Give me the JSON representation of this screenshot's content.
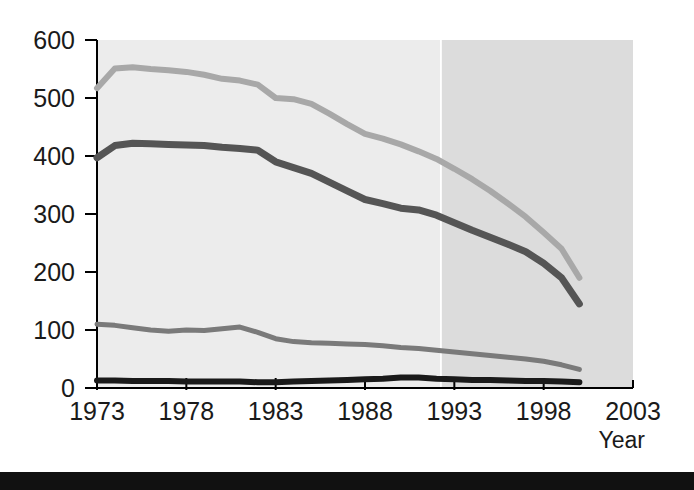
{
  "chart_data": {
    "type": "line",
    "title": "",
    "subtitle": "",
    "xlabel": "Year",
    "ylabel": "",
    "xlim": [
      1973,
      2003
    ],
    "ylim": [
      0,
      600
    ],
    "grid": false,
    "legend": "none",
    "x_ticks": [
      "1973",
      "1978",
      "1983",
      "1988",
      "1993",
      "1998",
      "2003"
    ],
    "x_tick_values": [
      1973,
      1978,
      1983,
      1988,
      1993,
      1998,
      2003
    ],
    "y_ticks": [
      "0",
      "100",
      "200",
      "300",
      "400",
      "500",
      "600"
    ],
    "y_tick_values": [
      0,
      100,
      200,
      300,
      400,
      500,
      600
    ],
    "x": [
      1973,
      1974,
      1975,
      1976,
      1977,
      1978,
      1979,
      1980,
      1981,
      1982,
      1983,
      1984,
      1985,
      1986,
      1987,
      1988,
      1989,
      1990,
      1991,
      1992,
      1993,
      1994,
      1995,
      1996,
      1997,
      1998,
      1999,
      2000
    ],
    "series": [
      {
        "name": "series-light-gray",
        "color": "#a8a8a8",
        "stroke_width": 6,
        "values": [
          517,
          551,
          553,
          550,
          548,
          545,
          540,
          533,
          530,
          523,
          500,
          498,
          490,
          473,
          455,
          438,
          430,
          420,
          408,
          395,
          378,
          360,
          340,
          318,
          295,
          268,
          240,
          190
        ]
      },
      {
        "name": "series-dark-gray",
        "color": "#555555",
        "stroke_width": 7,
        "values": [
          397,
          418,
          422,
          421,
          420,
          419,
          418,
          415,
          413,
          410,
          390,
          380,
          370,
          355,
          340,
          325,
          318,
          310,
          307,
          298,
          285,
          272,
          260,
          248,
          235,
          215,
          190,
          145
        ]
      },
      {
        "name": "series-medium-gray",
        "color": "#7a7a7a",
        "stroke_width": 5,
        "values": [
          110,
          108,
          104,
          100,
          98,
          100,
          99,
          102,
          105,
          96,
          85,
          80,
          78,
          77,
          76,
          75,
          73,
          70,
          68,
          65,
          62,
          59,
          56,
          53,
          50,
          46,
          40,
          32
        ]
      },
      {
        "name": "series-black",
        "color": "#1a1a1a",
        "stroke_width": 6,
        "values": [
          13,
          13,
          12,
          12,
          12,
          11,
          11,
          11,
          11,
          10,
          10,
          11,
          12,
          13,
          14,
          15,
          16,
          18,
          18,
          16,
          15,
          14,
          14,
          13,
          12,
          12,
          11,
          10
        ]
      }
    ],
    "shaded_region": {
      "label": "projection-shading",
      "x_start": 1992.3,
      "x_end": 2003,
      "color": "#dcdcdc"
    },
    "plot_background_color": "#ececec"
  },
  "figure": {
    "axis_title_x": "Year",
    "footer_bar_color": "#111111"
  }
}
